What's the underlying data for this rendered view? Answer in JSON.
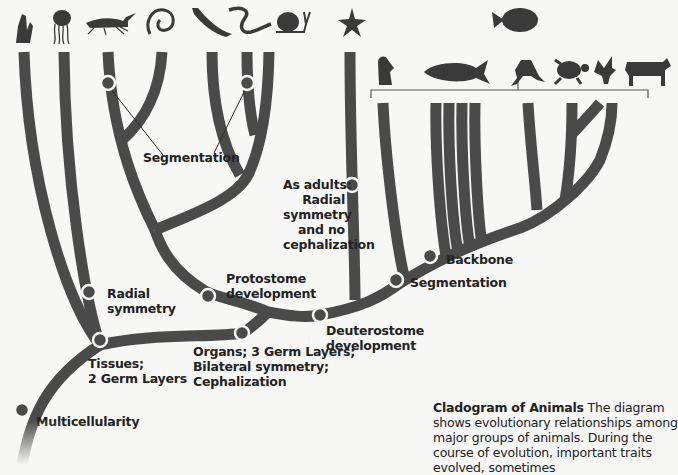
{
  "diagram": {
    "type": "cladogram",
    "title": "Cladogram of Animals",
    "taxa_icons": [
      {
        "id": "sponge",
        "icon": "sponge-icon"
      },
      {
        "id": "jellyfish",
        "icon": "jellyfish-icon"
      },
      {
        "id": "grasshopper",
        "icon": "grasshopper-icon"
      },
      {
        "id": "roundworm",
        "icon": "roundworm-icon"
      },
      {
        "id": "flatworm",
        "icon": "flatworm-icon"
      },
      {
        "id": "segmented-worm",
        "icon": "segmented-worm-icon"
      },
      {
        "id": "snail",
        "icon": "snail-icon"
      },
      {
        "id": "sea-star",
        "icon": "sea-star-icon"
      },
      {
        "id": "fish-group",
        "icon": "fish-icon",
        "subgroup": [
          "lamprey",
          "bony-fish",
          "frog",
          "turtle",
          "bird",
          "cow"
        ]
      }
    ],
    "traits": {
      "multicellularity": "Multicellularity",
      "tissues_line1": "Tissues;",
      "tissues_line2": "2 Germ Layers",
      "radial_line1": "Radial",
      "radial_line2": "symmetry",
      "organs_line1": "Organs; 3 Germ Layers;",
      "organs_line2": "Bilateral symmetry;",
      "organs_line3": "Cephalization",
      "protostome_line1": "Protostome",
      "protostome_line2": "development",
      "deuterostome_line1": "Deuterostome",
      "deuterostome_line2": "development",
      "segmentation_invert": "Segmentation",
      "segmentation_chordate": "Segmentation",
      "backbone": "Backbone",
      "adults_line1": "As adults:",
      "adults_line2": "Radial",
      "adults_line3": "symmetry",
      "adults_line4": "and no",
      "adults_line5": "cephalization"
    },
    "caption": {
      "title": "Cladogram of Animals",
      "text": "The diagram shows evolutionary relationships among major groups of animals. During the course of evolution, important traits evolved, sometimes"
    },
    "colors": {
      "branch": "#4a4a4a",
      "background": "#f7f7f5",
      "text": "#222222"
    }
  }
}
